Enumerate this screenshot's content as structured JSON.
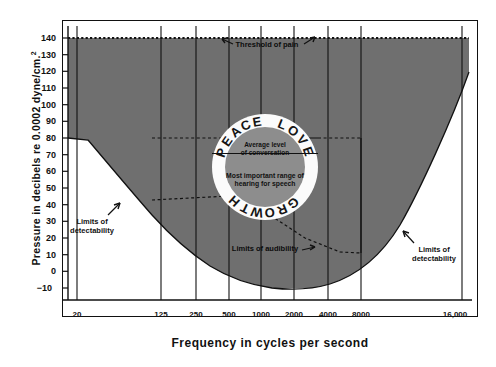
{
  "figure": {
    "y_axis_title": "Pressure in decibels re 0.0002 dyne/cm.",
    "y_axis_title_sup": "2",
    "x_axis_title": "Frequency in cycles per second"
  },
  "annotations": {
    "threshold_of_pain": "Threshold of pain",
    "limits_of_detectability_left_line1": "Limits of",
    "limits_of_detectability_left_line2": "detectability",
    "limits_of_detectability_right_line1": "Limits of",
    "limits_of_detectability_right_line2": "detectability",
    "limits_of_audibility": "Limits of audibility",
    "average_level_line1": "Average level",
    "average_level_line2": "of conversation",
    "speech_range_line1": "Most important range of",
    "speech_range_line2": "hearing for speech"
  },
  "ring": {
    "text": "PEACE LOVE GROWTH",
    "letters": [
      "P",
      "E",
      "A",
      "C",
      "E",
      "L",
      "O",
      "V",
      "E",
      "G",
      "R",
      "O",
      "W",
      "T",
      "H"
    ]
  },
  "colors": {
    "shaded_region": "#6f6f6f",
    "inner_disc": "#8d8d8d",
    "ring_disc": "#fbfbfb",
    "axis": "#111111",
    "background": "#ffffff"
  },
  "chart_data": {
    "type": "area",
    "title": "",
    "subtitle": "",
    "xlabel": "Frequency in cycles per second",
    "ylabel": "Pressure in decibels re 0.0002 dyne/cm.2",
    "xscale": "log",
    "xlim": [
      20,
      16000
    ],
    "ylim": [
      -10,
      140
    ],
    "grid": false,
    "legend": null,
    "x_ticks": [
      20,
      125,
      250,
      500,
      1000,
      2000,
      4000,
      8000,
      16000
    ],
    "x_tick_labels": [
      "20",
      "125",
      "250",
      "500",
      "1000",
      "2000",
      "4000",
      "8000",
      "16,000"
    ],
    "y_ticks": [
      -10,
      0,
      10,
      20,
      30,
      40,
      50,
      60,
      70,
      80,
      90,
      100,
      110,
      120,
      130,
      140
    ],
    "y_tick_labels": [
      "−10",
      "0",
      "10",
      "20",
      "30",
      "40",
      "50",
      "60",
      "70",
      "80",
      "90",
      "100",
      "110",
      "120",
      "130",
      "140"
    ],
    "series": [
      {
        "name": "Threshold of pain (upper boundary)",
        "style": "dotted",
        "x": [
          20,
          125,
          250,
          500,
          1000,
          2000,
          4000,
          8000,
          16000
        ],
        "y": [
          140,
          140,
          140,
          140,
          140,
          140,
          140,
          140,
          140
        ]
      },
      {
        "name": "Limits of audibility / detectability (lower boundary)",
        "style": "solid",
        "x": [
          20,
          60,
          125,
          250,
          500,
          1000,
          2000,
          3000,
          4000,
          6000,
          8000,
          12000,
          16000
        ],
        "y": [
          80,
          57,
          38,
          24,
          12,
          4,
          -8,
          -10,
          -8,
          3,
          22,
          72,
          120
        ]
      }
    ],
    "regions": [
      {
        "name": "audible-field",
        "fill": "#6f6f6f",
        "description": "Region between threshold of audibility and threshold of pain"
      },
      {
        "name": "speech-area",
        "outline": "dashed+solid",
        "x_range": [
          500,
          8000
        ],
        "y_top": 80,
        "y_bottom_range": [
          45,
          30
        ],
        "description": "Most important range of hearing for speech"
      }
    ]
  }
}
